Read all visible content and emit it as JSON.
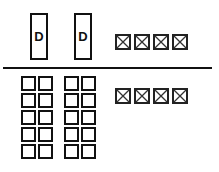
{
  "top_section": {
    "tall_boxes": [
      {
        "label": "D"
      },
      {
        "label": "D"
      }
    ],
    "crossed_boxes_count": 4
  },
  "bottom_section": {
    "grids": [
      {
        "rows": 5,
        "columns": 2
      },
      {
        "rows": 5,
        "columns": 2
      }
    ],
    "crossed_boxes_count": 4
  },
  "colors": {
    "stroke": "#111111",
    "background": "#ffffff"
  }
}
